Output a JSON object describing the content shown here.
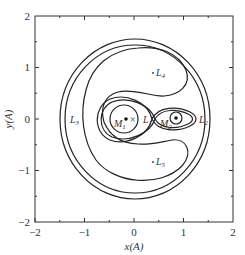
{
  "figure": {
    "type": "zero-velocity-curves",
    "xlabel": "x(A)",
    "ylabel": "y(A)",
    "xlim": [
      -2,
      2
    ],
    "ylim": [
      -2,
      2
    ],
    "x_ticks": [
      "−2",
      "−1",
      "0",
      "1",
      "2"
    ],
    "y_ticks": [
      "2",
      "1",
      "0",
      "−1",
      "−2"
    ],
    "points": {
      "L1": {
        "label": "L",
        "sub": "1",
        "x": 0.62,
        "y": 0
      },
      "L2": {
        "label": "L",
        "sub": "2",
        "x": 1.45,
        "y": 0
      },
      "L3": {
        "label": "L",
        "sub": "3",
        "x": -1.1,
        "y": 0
      },
      "L4": {
        "label": "L",
        "sub": "4",
        "x": 0.4,
        "y": 0.87
      },
      "L5": {
        "label": "L",
        "sub": "5",
        "x": 0.4,
        "y": -0.87
      },
      "M1": {
        "label": "M",
        "sub": "1",
        "x": -0.15,
        "y": 0
      },
      "M2": {
        "label": "M",
        "sub": "2",
        "x": 0.85,
        "y": 0
      },
      "barycenter": {
        "symbol": "×",
        "x": 0.0,
        "y": 0
      }
    }
  }
}
